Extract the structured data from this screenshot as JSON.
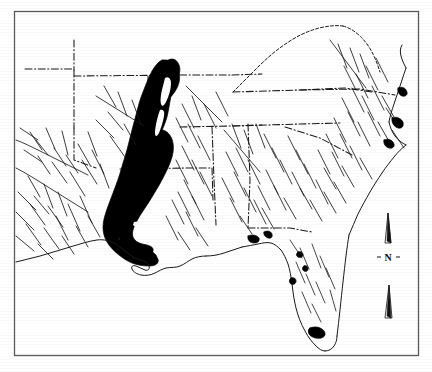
{
  "figure": {
    "kind": "map",
    "title": "",
    "caption": "",
    "region_described": "Southeastern United States",
    "background_color": "#ffffff",
    "ink_color": "#1a1a1a",
    "shaded_region_color": "#000000",
    "border": {
      "present": true,
      "color": "#555555",
      "style": "thin rectangular frame",
      "left": 14,
      "top": 11,
      "right": 419,
      "bottom": 356
    }
  },
  "legend_items": [
    {
      "name": "shaded-area",
      "label": "",
      "color": "#000000",
      "description": "Solid black elongated band following the Mississippi alluvial valley from north-central down to the Gulf coast delta"
    },
    {
      "name": "river-network",
      "label": "",
      "color": "#1a1a1a",
      "description": "Thin black dendritic stream and river lines"
    },
    {
      "name": "state-boundary",
      "label": "",
      "color": "#1a1a1a",
      "description": "Dash-dot political boundary lines"
    }
  ],
  "compass": {
    "name": "north-arrow",
    "label": "N",
    "left_tick": "-",
    "right_tick": "-",
    "orientation_degrees": 0,
    "x": 390,
    "y": 212,
    "height": 110
  },
  "annotations": []
}
